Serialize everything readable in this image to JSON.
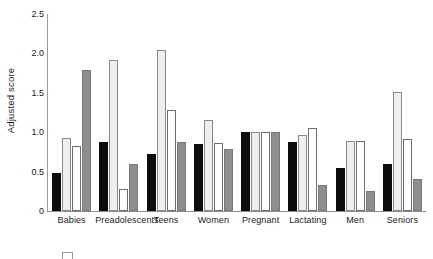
{
  "chart_data": {
    "type": "bar",
    "title": "",
    "subtitle": "",
    "xlabel": "",
    "ylabel": "Adjusted score",
    "ylim": [
      0,
      2.5
    ],
    "yticks": [
      "0",
      "0.5",
      "1.0",
      "1.5",
      "2.0",
      "2.5"
    ],
    "ytick_values": [
      0,
      0.5,
      1.0,
      1.5,
      2.0,
      2.5
    ],
    "grid": false,
    "legend_position": "below-plot-cropped",
    "categories": [
      "Babies",
      "Preadolescents",
      "Teens",
      "Women",
      "Pregnant",
      "Lactating",
      "Men",
      "Seniors"
    ],
    "series": [
      {
        "name": "series-1",
        "fill": "black",
        "color": "#0d0d0d",
        "values": [
          0.48,
          0.88,
          0.72,
          0.85,
          1.0,
          0.88,
          0.55,
          0.6
        ]
      },
      {
        "name": "series-2",
        "fill": "light-gray",
        "color": "#eeeeea",
        "values": [
          0.93,
          1.92,
          2.04,
          1.15,
          1.0,
          0.97,
          0.89,
          1.51
        ]
      },
      {
        "name": "series-3",
        "fill": "white",
        "color": "#ffffff",
        "values": [
          0.82,
          0.28,
          1.28,
          0.86,
          1.0,
          1.05,
          0.89,
          0.92
        ]
      },
      {
        "name": "series-4",
        "fill": "medium-gray",
        "color": "#8e8e8e",
        "values": [
          1.79,
          0.6,
          0.88,
          0.79,
          1.0,
          0.33,
          0.26,
          0.4
        ]
      }
    ]
  }
}
